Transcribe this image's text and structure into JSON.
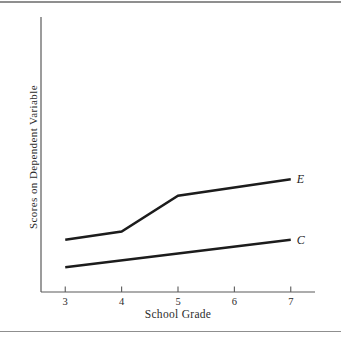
{
  "figure": {
    "background": "#ffffff",
    "rule_color": "#8f8f8f"
  },
  "chart_data": {
    "type": "line",
    "title": "",
    "xlabel": "School Grade",
    "ylabel": "Scores on Dependent Variable",
    "x_ticks": [
      3,
      4,
      5,
      6,
      7
    ],
    "xlim": [
      2.57,
      7.43
    ],
    "ylim": [
      0,
      100
    ],
    "y_ticks": [],
    "grid": false,
    "legend_position": "line-end-labels",
    "axis_color": "#5a5a5a",
    "line_color": "#1c1c1c",
    "tick_label_color": "#2b2b2b",
    "series": [
      {
        "name": "E",
        "x": [
          3,
          4,
          5,
          7
        ],
        "y": [
          19,
          22,
          35,
          41
        ]
      },
      {
        "name": "C",
        "x": [
          3,
          7
        ],
        "y": [
          9,
          19
        ]
      }
    ]
  }
}
